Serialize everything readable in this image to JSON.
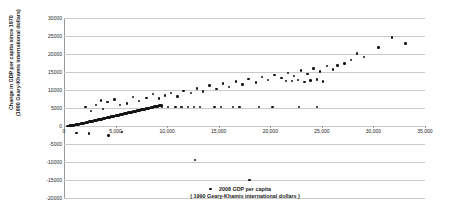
{
  "chart_data": {
    "type": "scatter",
    "title": "",
    "xlabel": "2008 GDP per capita",
    "xlabel_line2": "( 1990 Geary-Khamis international dollars )",
    "ylabel": "Change in GDP per capita since 1970",
    "ylabel_line2": "(1990 Geary-Khamis international dollars)",
    "xlim": [
      0,
      35000
    ],
    "ylim": [
      -20000,
      30000
    ],
    "xticks": [
      0,
      5000,
      10000,
      15000,
      20000,
      25000,
      30000,
      35000
    ],
    "xtick_labels": [
      "0",
      "5,000",
      "10,000",
      "15,000",
      "20,000",
      "25,000",
      "30,000",
      "35,000"
    ],
    "yticks": [
      -20000,
      -15000,
      -10000,
      -5000,
      0,
      5000,
      10000,
      15000,
      20000,
      25000,
      30000
    ],
    "ytick_labels": [
      "-20000",
      "-15000",
      "-10000",
      "-5000",
      "0",
      "5000",
      "10000",
      "15000",
      "20000",
      "25000",
      "30000"
    ],
    "grid": true,
    "grid_axis": "y",
    "legend": false,
    "marker_color": "#151515",
    "gridline_color": "#c9c9c9",
    "axis_color": "#9a9a9a",
    "series": [
      {
        "name": "Countries",
        "points": [
          [
            330,
            -60
          ],
          [
            420,
            10
          ],
          [
            480,
            40
          ],
          [
            520,
            -30
          ],
          [
            560,
            90
          ],
          [
            610,
            120
          ],
          [
            660,
            60
          ],
          [
            700,
            150
          ],
          [
            740,
            -20
          ],
          [
            790,
            200
          ],
          [
            830,
            180
          ],
          [
            880,
            240
          ],
          [
            920,
            130
          ],
          [
            960,
            300
          ],
          [
            1010,
            260
          ],
          [
            1060,
            340
          ],
          [
            1100,
            200
          ],
          [
            1150,
            380
          ],
          [
            1190,
            420
          ],
          [
            1240,
            310
          ],
          [
            1290,
            460
          ],
          [
            1330,
            360
          ],
          [
            1380,
            520
          ],
          [
            1420,
            430
          ],
          [
            1470,
            560
          ],
          [
            1510,
            480
          ],
          [
            1560,
            620
          ],
          [
            1600,
            540
          ],
          [
            1650,
            660
          ],
          [
            1700,
            580
          ],
          [
            1750,
            720
          ],
          [
            1790,
            640
          ],
          [
            1840,
            780
          ],
          [
            1880,
            700
          ],
          [
            1930,
            840
          ],
          [
            1970,
            760
          ],
          [
            2020,
            900
          ],
          [
            2070,
            820
          ],
          [
            2110,
            960
          ],
          [
            2160,
            880
          ],
          [
            2200,
            1020
          ],
          [
            2250,
            940
          ],
          [
            2300,
            1080
          ],
          [
            2340,
            1000
          ],
          [
            2390,
            1140
          ],
          [
            2430,
            1060
          ],
          [
            2480,
            1200
          ],
          [
            2520,
            1120
          ],
          [
            2570,
            1260
          ],
          [
            2620,
            1180
          ],
          [
            2660,
            1320
          ],
          [
            2710,
            1240
          ],
          [
            2750,
            1380
          ],
          [
            2800,
            1300
          ],
          [
            2840,
            1440
          ],
          [
            2890,
            1360
          ],
          [
            2940,
            1500
          ],
          [
            2980,
            1420
          ],
          [
            3030,
            1560
          ],
          [
            3070,
            1480
          ],
          [
            3120,
            1620
          ],
          [
            3160,
            1540
          ],
          [
            3210,
            1700
          ],
          [
            3260,
            1600
          ],
          [
            3300,
            1760
          ],
          [
            3350,
            1680
          ],
          [
            3390,
            1820
          ],
          [
            3440,
            1740
          ],
          [
            3480,
            1880
          ],
          [
            3530,
            1800
          ],
          [
            3580,
            1940
          ],
          [
            3620,
            1860
          ],
          [
            3670,
            2000
          ],
          [
            3710,
            1920
          ],
          [
            3760,
            2060
          ],
          [
            3800,
            1980
          ],
          [
            3850,
            2120
          ],
          [
            3900,
            2040
          ],
          [
            3940,
            2180
          ],
          [
            3990,
            2100
          ],
          [
            4030,
            2240
          ],
          [
            4080,
            2160
          ],
          [
            4120,
            2300
          ],
          [
            4170,
            2220
          ],
          [
            4220,
            2380
          ],
          [
            4260,
            2280
          ],
          [
            4310,
            2440
          ],
          [
            4350,
            2340
          ],
          [
            4400,
            2500
          ],
          [
            4440,
            2400
          ],
          [
            4490,
            2560
          ],
          [
            4540,
            2460
          ],
          [
            4580,
            2620
          ],
          [
            4630,
            2520
          ],
          [
            4670,
            2680
          ],
          [
            4720,
            2580
          ],
          [
            4760,
            2740
          ],
          [
            4810,
            2640
          ],
          [
            4860,
            2800
          ],
          [
            4900,
            2700
          ],
          [
            4950,
            2860
          ],
          [
            4990,
            2760
          ],
          [
            5040,
            2920
          ],
          [
            5080,
            2820
          ],
          [
            5130,
            2980
          ],
          [
            5180,
            2880
          ],
          [
            5220,
            3040
          ],
          [
            5270,
            2940
          ],
          [
            5310,
            3100
          ],
          [
            5360,
            3000
          ],
          [
            5400,
            3160
          ],
          [
            5450,
            3060
          ],
          [
            5500,
            3220
          ],
          [
            5540,
            3120
          ],
          [
            5590,
            3280
          ],
          [
            5630,
            3180
          ],
          [
            5680,
            3340
          ],
          [
            5720,
            3240
          ],
          [
            5770,
            3400
          ],
          [
            5820,
            3300
          ],
          [
            5860,
            3460
          ],
          [
            5910,
            3360
          ],
          [
            5950,
            3520
          ],
          [
            6000,
            3420
          ],
          [
            6040,
            3580
          ],
          [
            6090,
            3480
          ],
          [
            6140,
            3640
          ],
          [
            6180,
            3540
          ],
          [
            6230,
            3700
          ],
          [
            6270,
            3600
          ],
          [
            6320,
            3760
          ],
          [
            6360,
            3660
          ],
          [
            6410,
            3820
          ],
          [
            6460,
            3720
          ],
          [
            6500,
            3880
          ],
          [
            6550,
            3780
          ],
          [
            6590,
            3940
          ],
          [
            6640,
            3840
          ],
          [
            6680,
            4000
          ],
          [
            6730,
            3900
          ],
          [
            6780,
            4060
          ],
          [
            6820,
            3960
          ],
          [
            6870,
            4120
          ],
          [
            6910,
            4020
          ],
          [
            6960,
            4180
          ],
          [
            7000,
            4080
          ],
          [
            7050,
            4240
          ],
          [
            7100,
            4140
          ],
          [
            7140,
            4300
          ],
          [
            7190,
            4200
          ],
          [
            7230,
            4360
          ],
          [
            7280,
            4260
          ],
          [
            7320,
            4420
          ],
          [
            7370,
            4320
          ],
          [
            7420,
            4480
          ],
          [
            7460,
            4380
          ],
          [
            7510,
            4540
          ],
          [
            7550,
            4440
          ],
          [
            7600,
            4600
          ],
          [
            7640,
            4500
          ],
          [
            7690,
            4660
          ],
          [
            7740,
            4560
          ],
          [
            7780,
            4720
          ],
          [
            7830,
            4620
          ],
          [
            7870,
            4780
          ],
          [
            7920,
            4680
          ],
          [
            7960,
            4840
          ],
          [
            8010,
            4740
          ],
          [
            8060,
            4900
          ],
          [
            8100,
            4800
          ],
          [
            8150,
            4960
          ],
          [
            8190,
            4860
          ],
          [
            8240,
            5020
          ],
          [
            8280,
            4920
          ],
          [
            8330,
            5080
          ],
          [
            8380,
            4980
          ],
          [
            8420,
            5140
          ],
          [
            8470,
            5040
          ],
          [
            8510,
            5200
          ],
          [
            8560,
            5100
          ],
          [
            8600,
            5260
          ],
          [
            8650,
            5160
          ],
          [
            8700,
            5320
          ],
          [
            8740,
            5220
          ],
          [
            8790,
            5380
          ],
          [
            8830,
            5280
          ],
          [
            8880,
            5440
          ],
          [
            8920,
            5340
          ],
          [
            8970,
            5500
          ],
          [
            9020,
            5400
          ],
          [
            9060,
            5560
          ],
          [
            9110,
            5460
          ],
          [
            9150,
            5620
          ],
          [
            9200,
            5520
          ],
          [
            9240,
            5680
          ],
          [
            9290,
            5580
          ],
          [
            9340,
            5740
          ],
          [
            9380,
            5640
          ],
          [
            9430,
            5800
          ],
          [
            9470,
            5700
          ],
          [
            3600,
            7100
          ],
          [
            4200,
            6600
          ],
          [
            4900,
            7400
          ],
          [
            5400,
            5800
          ],
          [
            6100,
            6300
          ],
          [
            6700,
            8100
          ],
          [
            7300,
            6900
          ],
          [
            8000,
            7800
          ],
          [
            8600,
            8900
          ],
          [
            9200,
            7600
          ],
          [
            9800,
            8500
          ],
          [
            10400,
            9200
          ],
          [
            11000,
            8200
          ],
          [
            11600,
            9800
          ],
          [
            12300,
            9100
          ],
          [
            12900,
            10400
          ],
          [
            13500,
            9600
          ],
          [
            14100,
            11200
          ],
          [
            14800,
            10200
          ],
          [
            15400,
            11800
          ],
          [
            16000,
            10800
          ],
          [
            16700,
            12400
          ],
          [
            17300,
            11500
          ],
          [
            17900,
            13000
          ],
          [
            18600,
            12100
          ],
          [
            19200,
            13600
          ],
          [
            19800,
            12800
          ],
          [
            20400,
            14200
          ],
          [
            21100,
            13400
          ],
          [
            21700,
            14800
          ],
          [
            22300,
            13900
          ],
          [
            23000,
            15400
          ],
          [
            23600,
            14500
          ],
          [
            24200,
            16000
          ],
          [
            24800,
            15100
          ],
          [
            25500,
            16600
          ],
          [
            26100,
            15700
          ],
          [
            27800,
            18400
          ],
          [
            28400,
            20100
          ],
          [
            29100,
            19200
          ],
          [
            30500,
            21800
          ],
          [
            31800,
            24600
          ],
          [
            33100,
            22900
          ],
          [
            2100,
            5300
          ],
          [
            2600,
            4100
          ],
          [
            3100,
            5900
          ],
          [
            3800,
            4700
          ],
          [
            10800,
            5300
          ],
          [
            11400,
            5300
          ],
          [
            12000,
            5300
          ],
          [
            12600,
            5300
          ],
          [
            13200,
            5300
          ],
          [
            9500,
            5300
          ],
          [
            10100,
            5300
          ],
          [
            8900,
            5300
          ],
          [
            14600,
            5300
          ],
          [
            15200,
            5300
          ],
          [
            16400,
            5300
          ],
          [
            17000,
            5300
          ],
          [
            18900,
            5300
          ],
          [
            20200,
            5300
          ],
          [
            22800,
            5300
          ],
          [
            24500,
            5300
          ],
          [
            12700,
            -9500
          ],
          [
            14200,
            -17500
          ],
          [
            18000,
            -15000
          ],
          [
            1200,
            -1900
          ],
          [
            2400,
            -2100
          ],
          [
            4300,
            -2600
          ],
          [
            5600,
            -1700
          ],
          [
            21500,
            12500
          ],
          [
            22100,
            12500
          ],
          [
            22700,
            12700
          ],
          [
            23300,
            12300
          ],
          [
            23900,
            12600
          ],
          [
            24500,
            12900
          ],
          [
            25100,
            12400
          ],
          [
            26500,
            16800
          ],
          [
            27200,
            17400
          ]
        ]
      }
    ]
  }
}
